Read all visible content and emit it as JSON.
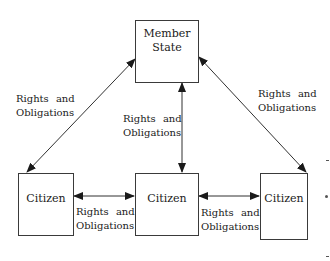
{
  "diagram": {
    "type": "relationship-diagram",
    "nodes": {
      "member_state": {
        "label_line1": "Member",
        "label_line2": "State"
      },
      "citizen_left": {
        "label": "Citizen"
      },
      "citizen_middle": {
        "label": "Citizen"
      },
      "citizen_right": {
        "label": "Citizen"
      }
    },
    "edges": [
      {
        "from": "member_state",
        "to": "citizen_left",
        "bidirectional": true,
        "label_line1": "Rights and",
        "label_line2": "Obligations"
      },
      {
        "from": "member_state",
        "to": "citizen_middle",
        "bidirectional": true,
        "label_line1": "Rights and",
        "label_line2": "Obligations"
      },
      {
        "from": "member_state",
        "to": "citizen_right",
        "bidirectional": true,
        "label_line1": "Rights and",
        "label_line2": "Obligations"
      },
      {
        "from": "citizen_left",
        "to": "citizen_middle",
        "bidirectional": true,
        "label_line1": "Rights and",
        "label_line2": "Obligations"
      },
      {
        "from": "citizen_middle",
        "to": "citizen_right",
        "bidirectional": true,
        "label_line1": "Rights and",
        "label_line2": "Obligations"
      }
    ],
    "colors": {
      "stroke": "#1a1a1a",
      "background": "#ffffff"
    }
  }
}
